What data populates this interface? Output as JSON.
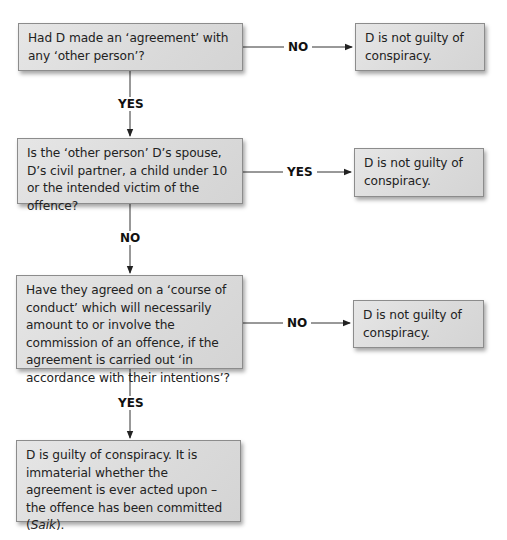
{
  "diagram": {
    "type": "flowchart",
    "nodes": [
      {
        "id": "q1",
        "text": "Had D made an ‘agreement’ with any ‘other person’?"
      },
      {
        "id": "r1",
        "text": "D is not guilty of conspiracy."
      },
      {
        "id": "q2",
        "text": "Is the ‘other person’ D’s spouse, D’s civil partner, a child under 10 or the intended victim of the offence?"
      },
      {
        "id": "r2",
        "text": "D is not guilty of conspiracy."
      },
      {
        "id": "q3",
        "text": "Have they agreed on a ‘course of conduct’ which will necessarily amount to or involve the commission of an offence, if the agreement is carried out ‘in accordance with their intentions’?"
      },
      {
        "id": "r3",
        "text": "D is not guilty of conspiracy."
      },
      {
        "id": "q4_main",
        "text": "D is guilty of conspiracy. It is immaterial whether the agreement is ever acted upon – the offence has been committed (",
        "case": "Saik",
        "tail": ")."
      }
    ],
    "edges": [
      {
        "from": "q1",
        "to": "r1",
        "label": "NO"
      },
      {
        "from": "q1",
        "to": "q2",
        "label": "YES"
      },
      {
        "from": "q2",
        "to": "r2",
        "label": "YES"
      },
      {
        "from": "q2",
        "to": "q3",
        "label": "NO"
      },
      {
        "from": "q3",
        "to": "r3",
        "label": "NO"
      },
      {
        "from": "q3",
        "to": "q4_main",
        "label": "YES"
      }
    ]
  },
  "labels": {
    "e1": "NO",
    "e2": "YES",
    "e3": "YES",
    "e4": "NO",
    "e5": "NO",
    "e6": "YES"
  },
  "colors": {
    "box_fill": "#dcdcdc",
    "box_border": "#8c8c8c",
    "line": "#333333",
    "background": "#ffffff"
  }
}
